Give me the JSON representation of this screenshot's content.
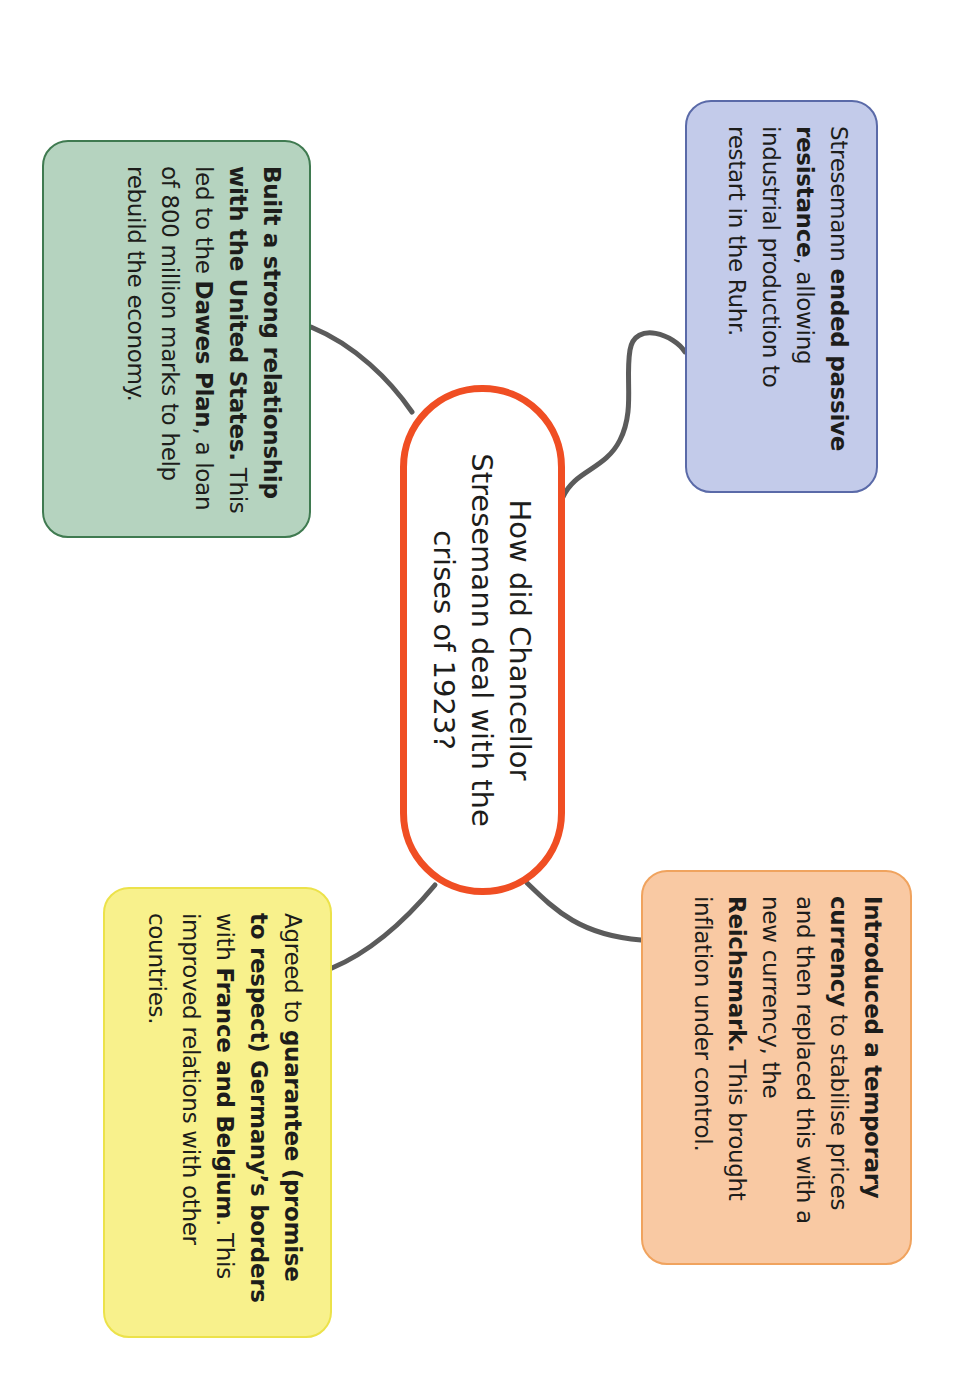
{
  "colors": {
    "central_border": "#f04e23",
    "connector": "#5b5b5b",
    "blue_fill": "#c3cbea",
    "blue_border": "#5a6aa8",
    "green_fill": "#b5d3bf",
    "green_border": "#3f7a50",
    "orange_fill": "#f9c9a3",
    "orange_border": "#f0a35e",
    "yellow_fill": "#f8f18c",
    "yellow_border": "#ece24a"
  },
  "orientation": "rotated 90 degrees clockwise",
  "central": {
    "lines": [
      "How did Chancellor",
      "Stresemann deal with the",
      "crises of 1923?"
    ]
  },
  "nodes": {
    "passive_resistance": {
      "segments": [
        {
          "text": "Stresemann ",
          "bold": false
        },
        {
          "text": "ended passive resistance",
          "bold": true
        },
        {
          "text": ", allowing industrial production to restart in the Ruhr.",
          "bold": false
        }
      ]
    },
    "currency": {
      "segments": [
        {
          "text": "Introduced a temporary currency",
          "bold": true
        },
        {
          "text": " to stabilise prices and then replaced this with a new currency, the ",
          "bold": false
        },
        {
          "text": "Reichsmark.",
          "bold": true
        },
        {
          "text": " This brought inflation under control.",
          "bold": false
        }
      ]
    },
    "united_states": {
      "segments": [
        {
          "text": "Built a strong relationship with the United States.",
          "bold": true
        },
        {
          "text": " This led to the ",
          "bold": false
        },
        {
          "text": "Dawes Plan",
          "bold": true
        },
        {
          "text": ", a loan of 800 million marks to help rebuild the economy.",
          "bold": false
        }
      ]
    },
    "borders": {
      "segments": [
        {
          "text": "Agreed to ",
          "bold": false
        },
        {
          "text": "guarantee (promise to respect) Germany’s borders",
          "bold": true
        },
        {
          "text": " with ",
          "bold": false
        },
        {
          "text": "France and Belgium",
          "bold": true
        },
        {
          "text": ". This improved relations with other countries.",
          "bold": false
        }
      ]
    }
  }
}
